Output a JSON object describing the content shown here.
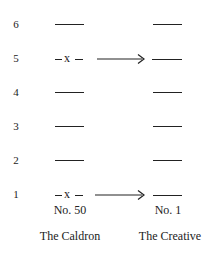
{
  "diagram": {
    "row_numbers": [
      "6",
      "5",
      "4",
      "3",
      "2",
      "1"
    ],
    "left_hexagram": {
      "number_label": "No. 50",
      "name": "The Caldron",
      "changing_lines": [
        5,
        1
      ],
      "change_marker": "-x-"
    },
    "right_hexagram": {
      "number_label": "No. 1",
      "name": "The Creative"
    },
    "arrows": [
      {
        "from_line": 5,
        "label": "arrow-icon"
      },
      {
        "from_line": 1,
        "label": "arrow-icon"
      }
    ]
  }
}
